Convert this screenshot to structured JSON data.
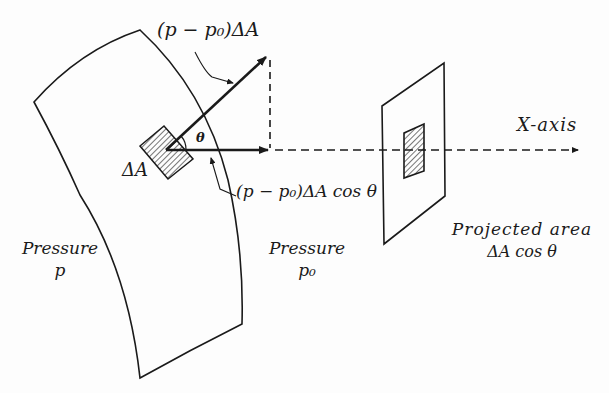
{
  "figure": {
    "labels": {
      "force_normal": "(p − p₀)ΔA",
      "force_x": "(p − p₀)ΔA cos θ",
      "theta": "θ",
      "delta_a": "ΔA",
      "pressure_inside_title": "Pressure",
      "pressure_inside_symbol": "p",
      "pressure_outside_title": "Pressure",
      "pressure_outside_symbol": "p₀",
      "x_axis": "X-axis",
      "projected_title": "Projected area",
      "projected_expr": "ΔA cos θ"
    },
    "colors": {
      "ink": "#1a1a1a",
      "background": "#fdfdfd"
    }
  }
}
